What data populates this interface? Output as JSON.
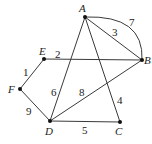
{
  "diagram": {
    "type": "weighted-graph",
    "vertices": [
      {
        "id": "A",
        "label": "A",
        "x": 85,
        "y": 17,
        "lx": 79,
        "ly": 12
      },
      {
        "id": "B",
        "label": "B",
        "x": 142,
        "y": 60,
        "lx": 144,
        "ly": 64
      },
      {
        "id": "C",
        "label": "C",
        "x": 120,
        "y": 122,
        "lx": 115,
        "ly": 135
      },
      {
        "id": "D",
        "label": "D",
        "x": 50,
        "y": 121,
        "lx": 45,
        "ly": 135
      },
      {
        "id": "E",
        "label": "E",
        "x": 44,
        "y": 59,
        "lx": 39,
        "ly": 55
      },
      {
        "id": "F",
        "label": "F",
        "x": 20,
        "y": 89,
        "lx": 8,
        "ly": 93
      }
    ],
    "edges": [
      {
        "from": "A",
        "to": "B",
        "weight": "3",
        "curved": false,
        "wx": 112,
        "wy": 36
      },
      {
        "from": "A",
        "to": "B",
        "weight": "7",
        "curved": true,
        "wx": 129,
        "wy": 26
      },
      {
        "from": "A",
        "to": "C",
        "weight": "4",
        "curved": false,
        "wx": 117,
        "wy": 104
      },
      {
        "from": "A",
        "to": "D",
        "weight": "6",
        "curved": false,
        "wx": 51,
        "wy": 96
      },
      {
        "from": "E",
        "to": "B",
        "weight": "2",
        "curved": false,
        "wx": 55,
        "wy": 58
      },
      {
        "from": "D",
        "to": "B",
        "weight": "8",
        "curved": false,
        "wx": 79,
        "wy": 96
      },
      {
        "from": "D",
        "to": "C",
        "weight": "5",
        "curved": false,
        "wx": 82,
        "wy": 134
      },
      {
        "from": "F",
        "to": "E",
        "weight": "1",
        "curved": false,
        "wx": 23,
        "wy": 76
      },
      {
        "from": "F",
        "to": "D",
        "weight": "9",
        "curved": false,
        "wx": 26,
        "wy": 115
      }
    ]
  }
}
